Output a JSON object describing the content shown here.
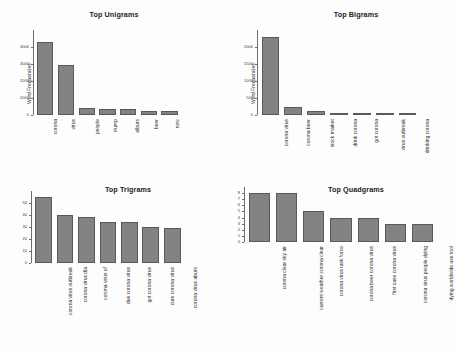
{
  "figure": {
    "background": "#fdfdfd",
    "bar_fill": "#838383",
    "bar_border": "#595959",
    "axis_color": "#6e6e6e",
    "text_color": "#2f2f2f"
  },
  "chart_data": [
    {
      "type": "bar",
      "title": "Top Unigrams",
      "xlabel": "",
      "ylabel": "Word Frequencies",
      "grid": false,
      "legend": false,
      "ylim": [
        0,
        5000
      ],
      "ytick_labels": [
        "0",
        "1000",
        "2000",
        "3000",
        "4000"
      ],
      "ytick_values": [
        0,
        1000,
        2000,
        3000,
        4000
      ],
      "categories": [
        "corona",
        "virus",
        "people",
        "trump",
        "alburs",
        "beer",
        "now"
      ],
      "values": [
        4300,
        2950,
        430,
        370,
        370,
        250,
        230
      ]
    },
    {
      "type": "bar",
      "title": "Top Bigrams",
      "xlabel": "",
      "ylabel": "Word Frequencies",
      "grid": false,
      "legend": false,
      "ylim": [
        0,
        2500
      ],
      "ytick_labels": [
        "0",
        "500",
        "1000",
        "1500",
        "2000"
      ],
      "ytick_values": [
        0,
        500,
        1000,
        1500,
        2000
      ],
      "categories": [
        "corona virus",
        "corona beer",
        "stock market",
        "drink corona",
        "got corona",
        "virus outbreak",
        "drinking corona"
      ],
      "values": [
        2300,
        250,
        110,
        60,
        60,
        60,
        40
      ]
    },
    {
      "type": "bar",
      "title": "Top Trigrams",
      "xlabel": "",
      "ylabel": "",
      "grid": false,
      "legend": false,
      "ylim": [
        0,
        60
      ],
      "ytick_labels": [
        "0",
        "10",
        "20",
        "30",
        "40",
        "50"
      ],
      "ytick_values": [
        0,
        10,
        20,
        30,
        40,
        50
      ],
      "categories": [
        "corona virus outbreak",
        "corona virus dla",
        "corona virus uf",
        "due corona virus",
        "got corona virus",
        "cure corona virus",
        "corona virus aburs"
      ],
      "values": [
        55,
        40,
        38,
        34,
        34,
        30,
        29
      ]
    },
    {
      "type": "bar",
      "title": "Top Quadgrams",
      "xlabel": "",
      "ylabel": "",
      "grid": false,
      "legend": false,
      "ylim": [
        0,
        9
      ],
      "ytick_labels": [
        "0",
        "1",
        "2",
        "3",
        "4",
        "5",
        "6",
        "7",
        "8"
      ],
      "ytick_values": [
        0,
        1,
        2,
        3,
        4,
        5,
        6,
        7,
        8
      ],
      "categories": [
        "corona clear sky air",
        "current weather corona clear",
        "corona virus task force",
        "corona beer corona virus",
        "first case corona virus",
        "corona virus people dying",
        "dying worldwide use tool"
      ],
      "values": [
        8,
        8,
        5,
        4,
        4,
        3,
        3
      ]
    }
  ]
}
